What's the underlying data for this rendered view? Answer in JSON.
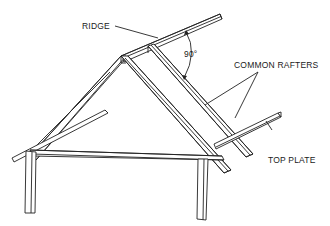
{
  "diagram": {
    "labels": {
      "ridge": "RIDGE",
      "angle": "90°",
      "common_rafters": "COMMON RAFTERS",
      "top_plate": "TOP PLATE"
    }
  }
}
